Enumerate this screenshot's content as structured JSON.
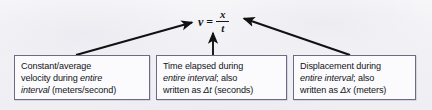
{
  "figure": {
    "kind": "physics-equation-callout-diagram",
    "background_color": "#f1f1f5",
    "box_border_color": "#6b6b86",
    "box_fill_color": "#fbfbfd",
    "arrow_color": "#111111",
    "text_color": "#131318"
  },
  "equation": {
    "variable": "v",
    "equals": "=",
    "numerator": "x",
    "denominator": "t",
    "plain": "v = x/t"
  },
  "callouts": [
    {
      "id": "velocity",
      "target": "v",
      "lines": [
        {
          "segments": [
            {
              "text": "Constant/average",
              "italic": false
            }
          ]
        },
        {
          "segments": [
            {
              "text": "velocity during ",
              "italic": false
            },
            {
              "text": "entire",
              "italic": true
            }
          ]
        },
        {
          "segments": [
            {
              "text": "interval",
              "italic": true
            },
            {
              "text": " (meters/second)",
              "italic": false
            }
          ]
        }
      ],
      "plain": "Constant/average velocity during entire interval (meters/second)"
    },
    {
      "id": "time",
      "target": "t",
      "lines": [
        {
          "segments": [
            {
              "text": "Time elapsed during",
              "italic": false
            }
          ]
        },
        {
          "segments": [
            {
              "text": "entire interval",
              "italic": true
            },
            {
              "text": "; also",
              "italic": false
            }
          ]
        },
        {
          "segments": [
            {
              "text": "written as ",
              "italic": false
            },
            {
              "text": "Δt",
              "italic": true
            },
            {
              "text": " (seconds)",
              "italic": false
            }
          ]
        }
      ],
      "plain": "Time elapsed during entire interval; also written as Δt (seconds)"
    },
    {
      "id": "displacement",
      "target": "x",
      "lines": [
        {
          "segments": [
            {
              "text": "Displacement during",
              "italic": false
            }
          ]
        },
        {
          "segments": [
            {
              "text": "entire interval",
              "italic": true
            },
            {
              "text": "; also",
              "italic": false
            }
          ]
        },
        {
          "segments": [
            {
              "text": "written as ",
              "italic": false
            },
            {
              "text": "Δx",
              "italic": true
            },
            {
              "text": " (meters)",
              "italic": false
            }
          ]
        }
      ],
      "plain": "Displacement during entire interval; also written as Δx (meters)"
    }
  ],
  "arrows": [
    {
      "id": "arrow-to-v",
      "from": [
        76,
        55
      ],
      "to": [
        193,
        22
      ],
      "points_to": "v"
    },
    {
      "id": "arrow-to-t",
      "from": [
        213,
        55
      ],
      "to": [
        213,
        32
      ],
      "points_to": "t"
    },
    {
      "id": "arrow-to-x",
      "from": [
        350,
        55
      ],
      "to": [
        243,
        18
      ],
      "points_to": "x"
    }
  ]
}
